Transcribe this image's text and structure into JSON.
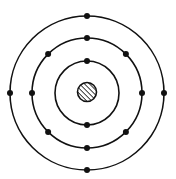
{
  "diagram": {
    "type": "bohr-atom-model",
    "nucleus": {
      "fill": "hatched"
    },
    "shells": [
      {
        "name": "inner",
        "electrons": 2
      },
      {
        "name": "middle",
        "electrons": 8
      },
      {
        "name": "outer",
        "electrons": 4
      }
    ],
    "colors": {
      "line": "#111111",
      "background": "#ffffff"
    }
  }
}
